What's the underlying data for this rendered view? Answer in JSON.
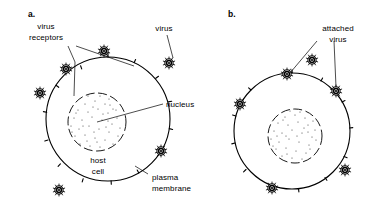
{
  "figure": {
    "background_color": "#ffffff",
    "ink_color": "#000000",
    "width": 390,
    "height": 222
  },
  "panels": [
    {
      "id": "a",
      "letter": "a.",
      "description": "Free virus particles near a host cell with virus receptors on the plasma membrane",
      "cell": {
        "center_x": 108,
        "center_y": 119,
        "radius": 62,
        "nucleus_radius": 29,
        "nucleus_center_x": 97,
        "nucleus_center_y": 122
      },
      "labels": [
        {
          "name": "virus-receptors",
          "text_lines": [
            "virus",
            "receptors"
          ],
          "x": 46,
          "y": 33
        },
        {
          "name": "virus",
          "text_lines": [
            "virus"
          ],
          "x": 160,
          "y": 29
        },
        {
          "name": "nucleus",
          "text_lines": [
            "nucleus"
          ],
          "x": 166,
          "y": 106
        },
        {
          "name": "host-cell",
          "text_lines": [
            "host",
            "cell"
          ],
          "x": 92,
          "y": 161
        },
        {
          "name": "plasma-membrane",
          "text_lines": [
            "plasma",
            "membrane"
          ],
          "x": 150,
          "y": 177
        }
      ],
      "free_viruses": [
        {
          "x": 104,
          "y": 51
        },
        {
          "x": 66,
          "y": 69
        },
        {
          "x": 169,
          "y": 63
        },
        {
          "x": 40,
          "y": 93
        },
        {
          "x": 161,
          "y": 151
        },
        {
          "x": 59,
          "y": 190
        }
      ],
      "attached_viruses": [],
      "receptor_count": 14
    },
    {
      "id": "b",
      "letter": "b.",
      "description": "Virus particles attached to receptors on the host cell plasma membrane",
      "cell": {
        "center_x": 292,
        "center_y": 131,
        "radius": 58,
        "nucleus_radius": 27,
        "nucleus_center_x": 295,
        "nucleus_center_y": 136
      },
      "labels": [
        {
          "name": "attached-virus",
          "text_lines": [
            "attached",
            "virus"
          ],
          "x": 320,
          "y": 32
        }
      ],
      "free_viruses": [
        {
          "x": 312,
          "y": 60
        }
      ],
      "attached_viruses": [
        {
          "x": 287,
          "y": 74
        },
        {
          "x": 336,
          "y": 91
        },
        {
          "x": 240,
          "y": 104
        },
        {
          "x": 345,
          "y": 170
        },
        {
          "x": 272,
          "y": 188
        }
      ],
      "receptor_count": 12
    }
  ],
  "virus_glyph": {
    "name": "virus-particle",
    "shell_radius": 4.2,
    "ring_radius": 2.4,
    "core_radius": 1.1,
    "spike_count": 10,
    "spike_length": 1.8
  },
  "legend_terms": [
    "virus receptors",
    "virus",
    "nucleus",
    "host cell",
    "plasma membrane",
    "attached virus"
  ]
}
